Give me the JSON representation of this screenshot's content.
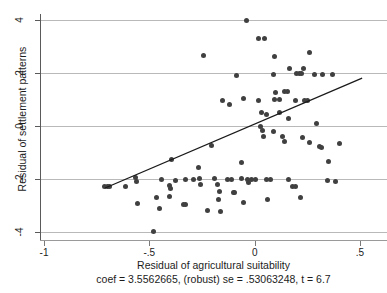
{
  "chart_data": {
    "type": "scatter",
    "title": "",
    "xlabel": "Residual of agricultural suitability",
    "ylabel": "Residual of settlement patterns",
    "xlim": [
      -1.0,
      0.5
    ],
    "ylim": [
      -4,
      4
    ],
    "xticks": [
      -1,
      -0.5,
      0,
      0.5
    ],
    "xticklabels": [
      "-1",
      "-.5",
      "0",
      ".5"
    ],
    "yticks": [
      -4,
      -2,
      0,
      2,
      4
    ],
    "yticklabels": [
      "-4",
      "-2",
      "0",
      "2",
      "4"
    ],
    "grid": "horizontal-only",
    "legend": "none",
    "point_color": "#404040",
    "line_color": "#1a1a1a",
    "grid_color": "#b9b9b9",
    "fit_line": {
      "type": "linear",
      "coef": 3.5562665,
      "robust_se": 0.53063248,
      "t": 6.7,
      "x_start": -0.71,
      "y_start": -2.34,
      "x_end": 0.51,
      "y_end": 1.81
    },
    "annotation": "coef = 3.5562665, (robust) se = .53063248, t = 6.7",
    "points": [
      [
        -0.245,
        2.65
      ],
      [
        -0.04,
        3.97
      ],
      [
        -0.085,
        1.9
      ],
      [
        -0.155,
        0.98
      ],
      [
        -0.12,
        0.82
      ],
      [
        0.02,
        3.3
      ],
      [
        0.046,
        3.3
      ],
      [
        0.095,
        2.62
      ],
      [
        0.262,
        2.78
      ],
      [
        0.09,
        1.96
      ],
      [
        0.165,
        2.16
      ],
      [
        0.232,
        2.16
      ],
      [
        0.285,
        1.96
      ],
      [
        0.198,
        1.98
      ],
      [
        0.212,
        1.98
      ],
      [
        0.222,
        1.98
      ],
      [
        0.322,
        1.96
      ],
      [
        0.37,
        1.95
      ],
      [
        0.098,
        1.28
      ],
      [
        0.14,
        1.32
      ],
      [
        0.158,
        1.3
      ],
      [
        -0.055,
        1.02
      ],
      [
        0.02,
        0.98
      ],
      [
        0.096,
        1.0
      ],
      [
        0.116,
        1.0
      ],
      [
        0.195,
        0.98
      ],
      [
        0.238,
        0.98
      ],
      [
        0.252,
        0.98
      ],
      [
        0.12,
        0.52
      ],
      [
        0.058,
        0.42
      ],
      [
        0.162,
        0.3
      ],
      [
        0.292,
        0.1
      ],
      [
        0.028,
        -0.02
      ],
      [
        0.036,
        -0.18
      ],
      [
        0.04,
        -0.38
      ],
      [
        0.09,
        -0.22
      ],
      [
        0.132,
        -0.4
      ],
      [
        0.142,
        -0.58
      ],
      [
        0.228,
        -0.42
      ],
      [
        0.258,
        -0.62
      ],
      [
        0.308,
        -0.78
      ],
      [
        0.318,
        -0.8
      ],
      [
        -0.712,
        -2.28
      ],
      [
        -0.7,
        -2.28
      ],
      [
        -0.688,
        -2.3
      ],
      [
        -0.568,
        -1.96
      ],
      [
        -0.56,
        -2.1
      ],
      [
        -0.442,
        -2.0
      ],
      [
        -0.402,
        -2.26
      ],
      [
        -0.558,
        -2.92
      ],
      [
        -0.452,
        -3.1
      ],
      [
        -0.33,
        -2.96
      ],
      [
        -0.268,
        -1.58
      ],
      [
        -0.262,
        -1.98
      ],
      [
        -0.255,
        -2.2
      ],
      [
        -0.19,
        -1.98
      ],
      [
        -0.175,
        -2.22
      ],
      [
        -0.062,
        -1.36
      ],
      [
        -0.062,
        -1.98
      ],
      [
        -0.03,
        -2.12
      ],
      [
        0.006,
        -2.02
      ],
      [
        -0.1,
        -2.5
      ],
      [
        -0.098,
        -2.52
      ],
      [
        -0.168,
        -2.48
      ],
      [
        -0.172,
        -2.78
      ],
      [
        -0.34,
        -2.98
      ],
      [
        -0.33,
        -2.02
      ],
      [
        -0.292,
        -2.02
      ],
      [
        -0.378,
        -2.04
      ],
      [
        -0.396,
        -1.28
      ],
      [
        -0.4,
        -2.36
      ],
      [
        -0.405,
        -2.66
      ],
      [
        -0.466,
        -2.68
      ],
      [
        -0.478,
        -3.98
      ],
      [
        -0.222,
        -3.2
      ],
      [
        -0.16,
        -3.22
      ],
      [
        -0.055,
        -2.88
      ],
      [
        0.06,
        -2.76
      ],
      [
        0.178,
        -2.3
      ],
      [
        0.192,
        -2.3
      ],
      [
        0.218,
        -2.68
      ],
      [
        0.345,
        -2.06
      ],
      [
        0.352,
        -1.34
      ],
      [
        0.382,
        -2.08
      ],
      [
        0.058,
        -2.02
      ],
      [
        0.076,
        -2.02
      ],
      [
        -0.205,
        -0.74
      ],
      [
        0.405,
        -0.66
      ],
      [
        -0.612,
        -2.3
      ],
      [
        -0.035,
        -2.02
      ],
      [
        -0.016,
        -2.02
      ],
      [
        0.16,
        -2.02
      ],
      [
        -0.128,
        -2.02
      ],
      [
        -0.112,
        -2.02
      ],
      [
        0.032,
        0.5
      ]
    ]
  }
}
